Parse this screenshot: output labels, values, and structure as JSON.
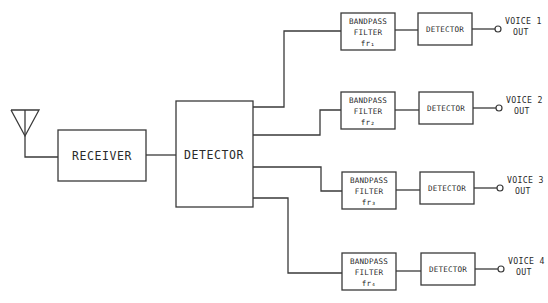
{
  "diagram": {
    "antenna": {
      "icon": "antenna-icon"
    },
    "receiver": {
      "label": "RECEIVER"
    },
    "main_detector": {
      "label": "DETECTOR"
    },
    "channels": [
      {
        "filter_line1": "BANDPASS",
        "filter_line2": "FILTER",
        "filter_freq": "fr₁",
        "detector": "DETECTOR",
        "out_line1": "VOICE 1",
        "out_line2": "OUT"
      },
      {
        "filter_line1": "BANDPASS",
        "filter_line2": "FILTER",
        "filter_freq": "fr₂",
        "detector": "DETECTOR",
        "out_line1": "VOICE 2",
        "out_line2": "OUT"
      },
      {
        "filter_line1": "BANDPASS",
        "filter_line2": "FILTER",
        "filter_freq": "fr₃",
        "detector": "DETECTOR",
        "out_line1": "VOICE 3",
        "out_line2": "OUT"
      },
      {
        "filter_line1": "BANDPASS",
        "filter_line2": "FILTER",
        "filter_freq": "fr₄",
        "detector": "DETECTOR",
        "out_line1": "VOICE 4",
        "out_line2": "OUT"
      }
    ],
    "colors": {
      "line": "#3a3a3a",
      "text": "#2a2a2a",
      "background": "#ffffff"
    }
  }
}
